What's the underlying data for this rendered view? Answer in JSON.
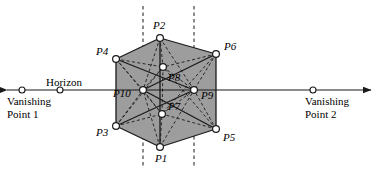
{
  "figure": {
    "colors": {
      "cube_fill": "#9d9d9d",
      "stroke": "#1a1a1a",
      "vertex_fill": "#ffffff",
      "background": "#ffffff"
    },
    "horizon": {
      "label": "Horizon",
      "y": 90,
      "x_start": 7,
      "x_end": 371,
      "left_vanishing_label_line1": "Vanishing",
      "left_vanishing_label_line2": "Point 1",
      "right_vanishing_label_line1": "Vanishing",
      "right_vanishing_label_line2": "Point 2",
      "markers": [
        {
          "name": "horizon-marker-left-outer",
          "x": 22,
          "y": 90
        },
        {
          "name": "horizon-marker-left-inner",
          "x": 60,
          "y": 90
        },
        {
          "name": "horizon-marker-right",
          "x": 313,
          "y": 90
        }
      ]
    },
    "guide_lines": {
      "vertical_dashed_x": [
        143,
        194
      ],
      "vertical_dashed_y_top": 6,
      "vertical_dashed_y_bottom": 166
    },
    "vertices": [
      {
        "id": "P1",
        "label": "P1",
        "x": 160,
        "y": 147,
        "label_x": 155,
        "label_y": 153
      },
      {
        "id": "P2",
        "label": "P2",
        "x": 160,
        "y": 38,
        "label_x": 153,
        "label_y": 20
      },
      {
        "id": "P3",
        "label": "P3",
        "x": 116,
        "y": 126,
        "label_x": 96,
        "label_y": 127
      },
      {
        "id": "P4",
        "label": "P4",
        "x": 116,
        "y": 59,
        "label_x": 96,
        "label_y": 46
      },
      {
        "id": "P5",
        "label": "P5",
        "x": 216,
        "y": 129,
        "label_x": 223,
        "label_y": 132
      },
      {
        "id": "P6",
        "label": "P6",
        "x": 216,
        "y": 54,
        "label_x": 224,
        "label_y": 41
      },
      {
        "id": "P7",
        "label": "P7",
        "x": 162,
        "y": 114,
        "label_x": 168,
        "label_y": 101
      },
      {
        "id": "P8",
        "label": "P8",
        "x": 163,
        "y": 67,
        "label_x": 168,
        "label_y": 72
      },
      {
        "id": "P9",
        "label": "P9",
        "x": 194,
        "y": 90,
        "label_x": 201,
        "label_y": 90
      },
      {
        "id": "P10",
        "label": "P10",
        "x": 143,
        "y": 90,
        "label_x": 113,
        "label_y": 88
      }
    ],
    "solid_edges": [
      [
        "P2",
        "P4"
      ],
      [
        "P4",
        "P3"
      ],
      [
        "P3",
        "P1"
      ],
      [
        "P1",
        "P5"
      ],
      [
        "P5",
        "P6"
      ],
      [
        "P6",
        "P2"
      ],
      [
        "P2",
        "P1"
      ],
      [
        "P4",
        "P9"
      ],
      [
        "P3",
        "P9"
      ],
      [
        "P6",
        "P10"
      ],
      [
        "P5",
        "P10"
      ]
    ],
    "dashed_edges": [
      [
        "P2",
        "P10"
      ],
      [
        "P2",
        "P9"
      ],
      [
        "P1",
        "P10"
      ],
      [
        "P1",
        "P9"
      ],
      [
        "P4",
        "P8"
      ],
      [
        "P6",
        "P8"
      ],
      [
        "P3",
        "P7"
      ],
      [
        "P5",
        "P7"
      ],
      [
        "P8",
        "P10"
      ],
      [
        "P8",
        "P9"
      ],
      [
        "P7",
        "P10"
      ],
      [
        "P7",
        "P9"
      ],
      [
        "P8",
        "P7"
      ],
      [
        "P4",
        "P10"
      ],
      [
        "P6",
        "P9"
      ],
      [
        "P3",
        "P10"
      ],
      [
        "P5",
        "P9"
      ],
      [
        "P4",
        "P7"
      ],
      [
        "P6",
        "P7"
      ],
      [
        "P3",
        "P8"
      ],
      [
        "P5",
        "P8"
      ],
      [
        "P2",
        "P8"
      ],
      [
        "P1",
        "P7"
      ]
    ],
    "cube_outline": [
      "P2",
      "P6",
      "P5",
      "P1",
      "P3",
      "P4"
    ]
  }
}
